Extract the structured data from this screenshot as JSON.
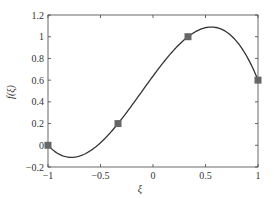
{
  "chart_data": {
    "type": "line",
    "title": "",
    "xlabel": "ξ",
    "ylabel": "f(ξ)",
    "xlim": [
      -1,
      1
    ],
    "ylim": [
      -0.2,
      1.2
    ],
    "xticks": [
      "-1",
      "-0.5",
      "0",
      "0.5",
      "1"
    ],
    "yticks": [
      "-0.2",
      "0",
      "0.2",
      "0.4",
      "0.6",
      "0.8",
      "1",
      "1.2"
    ],
    "grid": false,
    "series": [
      {
        "name": "interpolant",
        "kind": "line",
        "color": "#333333",
        "description": "cubic polynomial through the sample points"
      },
      {
        "name": "samples",
        "kind": "marker",
        "marker": "square",
        "color": "#666666",
        "x": [
          -1,
          -0.3333,
          0.3333,
          1
        ],
        "y": [
          0,
          0.2,
          1,
          0.6
        ]
      }
    ]
  }
}
